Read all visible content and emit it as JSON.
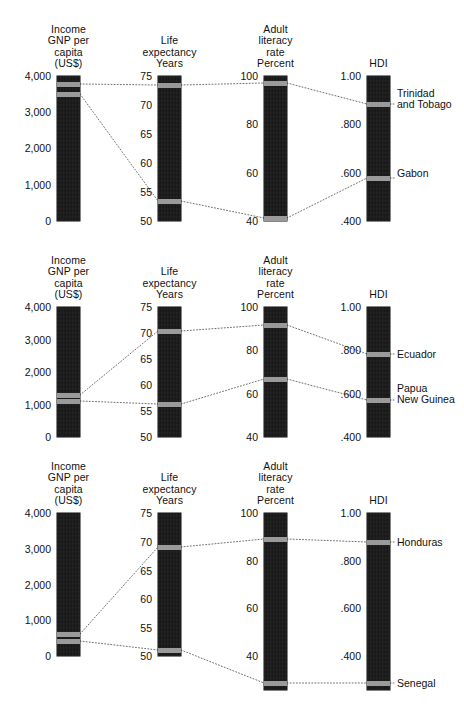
{
  "chart_data": {
    "type": "parallel-coordinates",
    "title": "",
    "axes": [
      {
        "id": "gnp",
        "label": "Income\nGNP per\ncapita\n(US$)",
        "ticks": [
          "4,000",
          "3,000",
          "2,000",
          "1,000",
          "0"
        ],
        "min": 0,
        "max": 4000
      },
      {
        "id": "life",
        "label": "Life\nexpectancy\nYears",
        "ticks": [
          "75",
          "70",
          "65",
          "60",
          "55",
          "50"
        ],
        "min": 50,
        "max": 75
      },
      {
        "id": "literacy",
        "label": "Adult\nliteracy\nrate\nPercent",
        "ticks": [
          "100",
          "80",
          "60",
          "40"
        ],
        "min": 40,
        "max": 100
      },
      {
        "id": "hdi",
        "label": "HDI",
        "ticks": [
          "1.00",
          ".800",
          ".600",
          ".400"
        ],
        "min": 0.4,
        "max": 1.0
      }
    ],
    "panels": [
      {
        "id": "panel-1",
        "countries": [
          {
            "name": "Trinidad\nand Tobago",
            "gnp": 3770,
            "life": 73.4,
            "literacy": 97.9,
            "hdi": 0.885
          },
          {
            "name": "Gabon",
            "gnp": 3490,
            "life": 53.5,
            "literacy": 41.0,
            "hdi": 0.579
          }
        ]
      },
      {
        "id": "panel-2",
        "countries": [
          {
            "name": "Ecuador",
            "gnp": 1280,
            "life": 69.3,
            "literacy": 91.6,
            "hdi": 0.775
          },
          {
            "name": "Papua\nNew Guinea",
            "gnp": 1120,
            "life": 55.3,
            "literacy": 65.1,
            "hdi": 0.57
          }
        ]
      },
      {
        "id": "panel-3",
        "countries": [
          {
            "name": "Honduras",
            "gnp": 600,
            "life": 69.0,
            "literacy": 89.0,
            "hdi": 0.856
          },
          {
            "name": "Senegal",
            "gnp": 520,
            "life": 50.3,
            "literacy": 28.5,
            "hdi": 0.258
          }
        ]
      }
    ],
    "xlabel": "",
    "ylabel": "",
    "grid": false,
    "legend": "right-inline-country-labels"
  },
  "panels": [
    {
      "name": "panel-1",
      "columns": [
        {
          "name": "income-gnp",
          "title": "Income\nGNP per\ncapita\n(US$)",
          "ticks": [
            {
              "label": "4,000",
              "y": 76
            },
            {
              "label": "3,000",
              "y": 112
            },
            {
              "label": "2,000",
              "y": 148
            },
            {
              "label": "1,000",
              "y": 185
            },
            {
              "label": "0",
              "y": 221
            }
          ],
          "bar": {
            "top": 76,
            "bottom": 221
          },
          "markers": [
            {
              "name": "Trinidad and Tobago",
              "y": 84
            },
            {
              "name": "Gabon",
              "y": 94
            }
          ]
        },
        {
          "name": "life-expectancy",
          "title": "Life\nexpectancy\nYears",
          "ticks": [
            {
              "label": "75",
              "y": 76
            },
            {
              "label": "70",
              "y": 105
            },
            {
              "label": "65",
              "y": 134
            },
            {
              "label": "60",
              "y": 163
            },
            {
              "label": "55",
              "y": 192
            },
            {
              "label": "50",
              "y": 221
            }
          ],
          "bar": {
            "top": 76,
            "bottom": 221
          },
          "markers": [
            {
              "name": "Trinidad and Tobago",
              "y": 85
            },
            {
              "name": "Gabon",
              "y": 201
            }
          ]
        },
        {
          "name": "adult-literacy",
          "title": "Adult\nliteracy\nrate\nPercent",
          "ticks": [
            {
              "label": "100",
              "y": 76
            },
            {
              "label": "80",
              "y": 124
            },
            {
              "label": "60",
              "y": 173
            },
            {
              "label": "40",
              "y": 221
            }
          ],
          "bar": {
            "top": 76,
            "bottom": 221
          },
          "markers": [
            {
              "name": "Trinidad and Tobago",
              "y": 83
            },
            {
              "name": "Gabon",
              "y": 218
            }
          ]
        },
        {
          "name": "hdi",
          "title": "HDI",
          "ticks": [
            {
              "label": "1.00",
              "y": 76
            },
            {
              "label": ".800",
              "y": 124
            },
            {
              "label": ".600",
              "y": 173
            },
            {
              "label": ".400",
              "y": 221
            }
          ],
          "bar": {
            "top": 76,
            "bottom": 221
          },
          "markers": [
            {
              "name": "Trinidad and Tobago",
              "y": 104
            },
            {
              "name": "Gabon",
              "y": 178
            }
          ]
        }
      ],
      "labels": [
        {
          "name": "Trinidad\nand Tobago",
          "y": 99
        },
        {
          "name": "Gabon",
          "y": 173
        }
      ]
    },
    {
      "name": "panel-2",
      "columns": [
        {
          "name": "income-gnp",
          "title": "Income\nGNP per\ncapita\n(US$)",
          "ticks": [
            {
              "label": "4,000",
              "y": 307
            },
            {
              "label": "3,000",
              "y": 340
            },
            {
              "label": "2,000",
              "y": 372
            },
            {
              "label": "1,000",
              "y": 405
            },
            {
              "label": "0",
              "y": 437
            }
          ],
          "bar": {
            "top": 307,
            "bottom": 437
          },
          "markers": [
            {
              "name": "Ecuador",
              "y": 395
            },
            {
              "name": "Papua New Guinea",
              "y": 401
            }
          ]
        },
        {
          "name": "life-expectancy",
          "title": "Life\nexpectancy\nYears",
          "ticks": [
            {
              "label": "75",
              "y": 307
            },
            {
              "label": "70",
              "y": 333
            },
            {
              "label": "65",
              "y": 359
            },
            {
              "label": "60",
              "y": 385
            },
            {
              "label": "55",
              "y": 411
            },
            {
              "label": "50",
              "y": 437
            }
          ],
          "bar": {
            "top": 307,
            "bottom": 437
          },
          "markers": [
            {
              "name": "Ecuador",
              "y": 331
            },
            {
              "name": "Papua New Guinea",
              "y": 404
            }
          ]
        },
        {
          "name": "adult-literacy",
          "title": "Adult\nliteracy\nrate\nPercent",
          "ticks": [
            {
              "label": "100",
              "y": 307
            },
            {
              "label": "80",
              "y": 350
            },
            {
              "label": "60",
              "y": 394
            },
            {
              "label": "40",
              "y": 437
            }
          ],
          "bar": {
            "top": 307,
            "bottom": 437
          },
          "markers": [
            {
              "name": "Ecuador",
              "y": 325
            },
            {
              "name": "Papua New Guinea",
              "y": 379
            }
          ]
        },
        {
          "name": "hdi",
          "title": "HDI",
          "ticks": [
            {
              "label": "1.00",
              "y": 307
            },
            {
              "label": ".800",
              "y": 350
            },
            {
              "label": ".600",
              "y": 394
            },
            {
              "label": ".400",
              "y": 437
            }
          ],
          "bar": {
            "top": 307,
            "bottom": 437
          },
          "markers": [
            {
              "name": "Ecuador",
              "y": 354
            },
            {
              "name": "Papua New Guinea",
              "y": 400
            }
          ]
        }
      ],
      "labels": [
        {
          "name": "Ecuador",
          "y": 354
        },
        {
          "name": "Papua\nNew Guinea",
          "y": 394
        }
      ]
    },
    {
      "name": "panel-3",
      "columns": [
        {
          "name": "income-gnp",
          "title": "Income\nGNP per\ncapita\n(US$)",
          "ticks": [
            {
              "label": "4,000",
              "y": 513
            },
            {
              "label": "3,000",
              "y": 549
            },
            {
              "label": "2,000",
              "y": 585
            },
            {
              "label": "1,000",
              "y": 620
            },
            {
              "label": "0",
              "y": 656
            }
          ],
          "bar": {
            "top": 513,
            "bottom": 656
          },
          "markers": [
            {
              "name": "Honduras",
              "y": 634
            },
            {
              "name": "Senegal",
              "y": 641
            }
          ]
        },
        {
          "name": "life-expectancy",
          "title": "Life\nexpectancy\nYears",
          "ticks": [
            {
              "label": "75",
              "y": 513
            },
            {
              "label": "70",
              "y": 542
            },
            {
              "label": "65",
              "y": 571
            },
            {
              "label": "60",
              "y": 599
            },
            {
              "label": "55",
              "y": 628
            },
            {
              "label": "50",
              "y": 656
            }
          ],
          "bar": {
            "top": 513,
            "bottom": 656
          },
          "markers": [
            {
              "name": "Honduras",
              "y": 547
            },
            {
              "name": "Senegal",
              "y": 650
            }
          ]
        },
        {
          "name": "adult-literacy",
          "title": "Adult\nliteracy\nrate\nPercent",
          "ticks": [
            {
              "label": "100",
              "y": 513
            },
            {
              "label": "80",
              "y": 561
            },
            {
              "label": "60",
              "y": 608
            },
            {
              "label": "40",
              "y": 656
            }
          ],
          "bar": {
            "top": 513,
            "bottom": 690
          },
          "markers": [
            {
              "name": "Honduras",
              "y": 539
            },
            {
              "name": "Senegal",
              "y": 683
            }
          ]
        },
        {
          "name": "hdi",
          "title": "HDI",
          "ticks": [
            {
              "label": "1.00",
              "y": 513
            },
            {
              "label": ".800",
              "y": 561
            },
            {
              "label": ".600",
              "y": 608
            },
            {
              "label": ".400",
              "y": 656
            }
          ],
          "bar": {
            "top": 513,
            "bottom": 690
          },
          "markers": [
            {
              "name": "Honduras",
              "y": 542
            },
            {
              "name": "Senegal",
              "y": 683
            }
          ]
        }
      ],
      "labels": [
        {
          "name": "Honduras",
          "y": 542
        },
        {
          "name": "Senegal",
          "y": 683
        }
      ]
    }
  ],
  "layout": {
    "bar_x": [
      57,
      158,
      264,
      367
    ],
    "bar_width": 23,
    "title_y": [
      18,
      256,
      478
    ],
    "marker_height": 5
  }
}
